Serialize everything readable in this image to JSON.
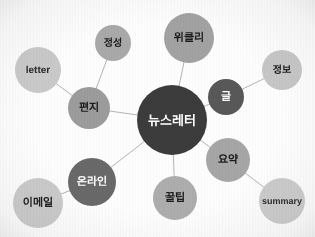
{
  "diagram": {
    "type": "mind-map",
    "title": "뉴스레터",
    "canvas": {
      "width": 315,
      "height": 237,
      "background": "#fdfdfd"
    },
    "center": {
      "id": "newsletter",
      "label": "뉴스레터",
      "cx": 172,
      "cy": 120,
      "r": 35,
      "fill": "#3c3c3c",
      "text_color": "#ffffff",
      "font_size": 13
    },
    "nodes": [
      {
        "id": "pyeonji",
        "label": "편지",
        "cx": 89,
        "cy": 108,
        "r": 21,
        "fill": "#9c9c9c",
        "text_color": "#1c1c1c",
        "font_size": 11
      },
      {
        "id": "letter",
        "label": "letter",
        "cx": 38,
        "cy": 70,
        "r": 23,
        "fill": "#c9c9c9",
        "text_color": "#2a2a2a",
        "font_size": 10
      },
      {
        "id": "jeongseong",
        "label": "정성",
        "cx": 113,
        "cy": 43,
        "r": 18,
        "fill": "#a9a9a9",
        "text_color": "#1c1c1c",
        "font_size": 10
      },
      {
        "id": "weekly",
        "label": "위클리",
        "cx": 189,
        "cy": 38,
        "r": 25,
        "fill": "#a2a2a2",
        "text_color": "#1c1c1c",
        "font_size": 11
      },
      {
        "id": "geul",
        "label": "글",
        "cx": 226,
        "cy": 97,
        "r": 18,
        "fill": "#585858",
        "text_color": "#ffffff",
        "font_size": 11
      },
      {
        "id": "jeongbo",
        "label": "정보",
        "cx": 282,
        "cy": 70,
        "r": 20,
        "fill": "#c6c6c6",
        "text_color": "#1c1c1c",
        "font_size": 10
      },
      {
        "id": "yoyak",
        "label": "요약",
        "cx": 228,
        "cy": 160,
        "r": 22,
        "fill": "#a6a6a6",
        "text_color": "#1c1c1c",
        "font_size": 11
      },
      {
        "id": "summary",
        "label": "summary",
        "cx": 282,
        "cy": 201,
        "r": 23,
        "fill": "#cbcbcb",
        "text_color": "#2a2a2a",
        "font_size": 9
      },
      {
        "id": "kkultip",
        "label": "꿀팁",
        "cx": 175,
        "cy": 198,
        "r": 22,
        "fill": "#adadad",
        "text_color": "#1c1c1c",
        "font_size": 11
      },
      {
        "id": "online",
        "label": "온라인",
        "cx": 92,
        "cy": 182,
        "r": 24,
        "fill": "#696969",
        "text_color": "#ffffff",
        "font_size": 11
      },
      {
        "id": "email",
        "label": "이메일",
        "cx": 38,
        "cy": 203,
        "r": 25,
        "fill": "#cacaca",
        "text_color": "#1c1c1c",
        "font_size": 11
      }
    ],
    "edges": [
      {
        "id": "edge-center-pyeonji",
        "from": "newsletter",
        "to": "pyeonji"
      },
      {
        "id": "edge-center-weekly",
        "from": "newsletter",
        "to": "weekly"
      },
      {
        "id": "edge-center-geul",
        "from": "newsletter",
        "to": "geul"
      },
      {
        "id": "edge-center-yoyak",
        "from": "newsletter",
        "to": "yoyak"
      },
      {
        "id": "edge-center-kkultip",
        "from": "newsletter",
        "to": "kkultip"
      },
      {
        "id": "edge-center-online",
        "from": "newsletter",
        "to": "online"
      },
      {
        "id": "edge-pyeonji-letter",
        "from": "pyeonji",
        "to": "letter"
      },
      {
        "id": "edge-pyeonji-jeongseong",
        "from": "pyeonji",
        "to": "jeongseong"
      },
      {
        "id": "edge-geul-jeongbo",
        "from": "geul",
        "to": "jeongbo"
      },
      {
        "id": "edge-yoyak-summary",
        "from": "yoyak",
        "to": "summary"
      },
      {
        "id": "edge-online-email",
        "from": "online",
        "to": "email"
      }
    ],
    "edge_style": {
      "stroke": "#b4b4b4",
      "stroke_width": 1
    }
  }
}
